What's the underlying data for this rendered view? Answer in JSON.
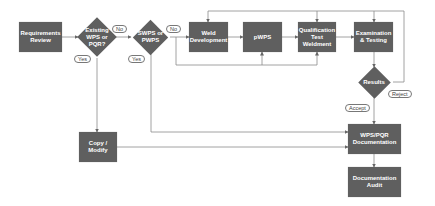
{
  "diagram": {
    "type": "flowchart",
    "colors": {
      "node_fill": "#5f5f5f",
      "node_text": "#ffffff",
      "connector": "#888888",
      "label_border": "#777777",
      "background": "#ffffff"
    },
    "nodes": {
      "requirements_review": "Requirements Review",
      "existing_wps": "Existing WPS or PQR?",
      "swps_pwps": "SWPS or PWPS",
      "weld_development": "Weld Development",
      "pwps": "pWPS",
      "qualification_test_weldment": "Qualification Test Weldment",
      "examination_testing": "Examination & Testing",
      "results": "Results",
      "copy_modify": "Copy / Modify",
      "wps_pqr_documentation": "WPS/PQR Documentation",
      "documentation_audit": "Documentation Audit"
    },
    "labels": {
      "existing_no": "No",
      "existing_yes": "Yes",
      "swps_no": "No",
      "swps_yes": "Yes",
      "results_reject": "Reject",
      "results_accept": "Accept"
    },
    "edges": [
      {
        "from": "Requirements Review",
        "to": "Existing WPS or PQR?"
      },
      {
        "from": "Existing WPS or PQR?",
        "to": "SWPS or PWPS",
        "label": "No"
      },
      {
        "from": "Existing WPS or PQR?",
        "to": "Copy / Modify",
        "label": "Yes"
      },
      {
        "from": "SWPS or PWPS",
        "to": "Weld Development",
        "label": "No"
      },
      {
        "from": "SWPS or PWPS",
        "to": "WPS/PQR Documentation",
        "label": "Yes"
      },
      {
        "from": "Weld Development",
        "to": "pWPS"
      },
      {
        "from": "pWPS",
        "to": "Qualification Test Weldment"
      },
      {
        "from": "Qualification Test Weldment",
        "to": "Examination & Testing"
      },
      {
        "from": "Examination & Testing",
        "to": "Results"
      },
      {
        "from": "Results",
        "to": "Weld Development",
        "label": "Reject"
      },
      {
        "from": "Results",
        "to": "WPS/PQR Documentation",
        "label": "Accept"
      },
      {
        "from": "Copy / Modify",
        "to": "WPS/PQR Documentation"
      },
      {
        "from": "WPS/PQR Documentation",
        "to": "Documentation Audit"
      }
    ]
  }
}
